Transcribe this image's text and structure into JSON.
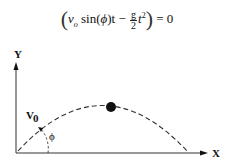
{
  "equation": {
    "lhs_v": "v",
    "lhs_v_sub": "o",
    "sin_term": " sin(",
    "phi": "ϕ",
    "after_phi": ")t − ",
    "frac_num": "g",
    "frac_den": "2",
    "t_term": "t",
    "t_exp": "2",
    "rhs": " = 0"
  },
  "diagram": {
    "y_label": "Y",
    "x_label": "X",
    "velocity_label": "V",
    "velocity_sub": "0",
    "angle_label": "ϕ",
    "colors": {
      "ink": "#111111",
      "background": "#ffffff"
    }
  }
}
